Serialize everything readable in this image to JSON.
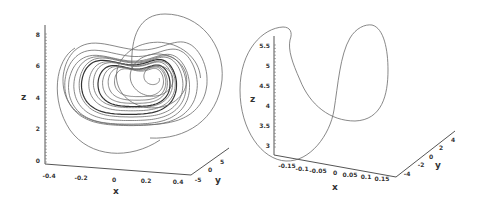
{
  "chart_data": [
    {
      "type": "line",
      "subtype": "3d-trajectory",
      "title": "",
      "description": "Chaotic attractor trajectory (many winding loops)",
      "xlabel": "x",
      "ylabel": "y",
      "zlabel": "z",
      "xlim": [
        -0.4,
        0.4
      ],
      "ylim": [
        -5,
        5
      ],
      "zlim": [
        0,
        8
      ],
      "x_ticks": [
        "-0.4",
        "-0.2",
        "0",
        "0.2",
        "0.4"
      ],
      "y_ticks": [
        "-5",
        "0",
        "5"
      ],
      "z_ticks": [
        "0",
        "2",
        "4",
        "6",
        "8"
      ],
      "series": [
        {
          "name": "trajectory",
          "color": "#6a6a6a"
        }
      ]
    },
    {
      "type": "line",
      "subtype": "3d-trajectory",
      "title": "",
      "description": "Periodic limit cycle (single closed loop)",
      "xlabel": "x",
      "ylabel": "y",
      "zlabel": "z",
      "xlim": [
        -0.15,
        0.15
      ],
      "ylim": [
        -4,
        4
      ],
      "zlim": [
        3,
        5.5
      ],
      "x_ticks": [
        "-0.15",
        "-0.1",
        "-0.05",
        "0",
        "0.05",
        "0.1",
        "0.15"
      ],
      "y_ticks": [
        "-4",
        "-2",
        "0",
        "2",
        "4"
      ],
      "z_ticks": [
        "3",
        "3.5",
        "4",
        "4.5",
        "5",
        "5.5"
      ],
      "series": [
        {
          "name": "limit-cycle",
          "color": "#6a6a6a"
        }
      ]
    }
  ]
}
